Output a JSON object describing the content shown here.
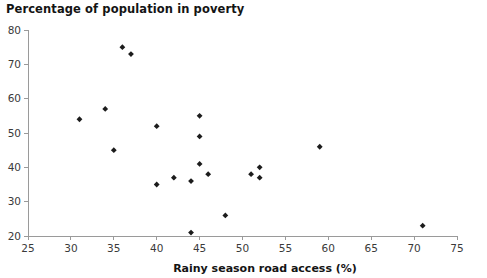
{
  "chart_data": {
    "type": "scatter",
    "title": "Percentage of population in poverty",
    "xlabel": "Rainy season road access (%)",
    "ylabel": "",
    "xlim": [
      25,
      75
    ],
    "ylim": [
      20,
      80
    ],
    "xticks": [
      25,
      30,
      35,
      40,
      45,
      50,
      55,
      60,
      65,
      70,
      75
    ],
    "yticks": [
      20,
      30,
      40,
      50,
      60,
      70,
      80
    ],
    "grid": false,
    "legend": null,
    "marker": "diamond",
    "marker_color": "#1c1c1c",
    "points": [
      {
        "x": 31,
        "y": 54
      },
      {
        "x": 34,
        "y": 57
      },
      {
        "x": 35,
        "y": 45
      },
      {
        "x": 36,
        "y": 75
      },
      {
        "x": 37,
        "y": 73
      },
      {
        "x": 40,
        "y": 52
      },
      {
        "x": 40,
        "y": 35
      },
      {
        "x": 42,
        "y": 37
      },
      {
        "x": 44,
        "y": 36
      },
      {
        "x": 44,
        "y": 21
      },
      {
        "x": 45,
        "y": 55
      },
      {
        "x": 45,
        "y": 49
      },
      {
        "x": 45,
        "y": 41
      },
      {
        "x": 46,
        "y": 38
      },
      {
        "x": 48,
        "y": 26
      },
      {
        "x": 51,
        "y": 38
      },
      {
        "x": 52,
        "y": 40
      },
      {
        "x": 52,
        "y": 37
      },
      {
        "x": 59,
        "y": 46
      },
      {
        "x": 71,
        "y": 23
      }
    ]
  }
}
